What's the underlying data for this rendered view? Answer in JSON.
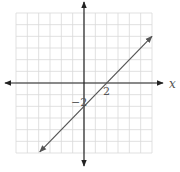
{
  "chart_data": {
    "type": "line",
    "title": "",
    "xlabel": "x",
    "ylabel": "",
    "xlim": [
      -6,
      6
    ],
    "ylim": [
      -6,
      6
    ],
    "grid": true,
    "grid_step": 1,
    "legend": null,
    "series": [
      {
        "name": "y = x - 2",
        "slope": 1,
        "intercept": -2,
        "x": [
          -3.9,
          6.0
        ],
        "y": [
          -5.9,
          4.0
        ],
        "arrows": "both"
      }
    ],
    "annotations": [
      {
        "text": "2",
        "x": 2,
        "y": 0,
        "position": "below-right"
      },
      {
        "text": "−2",
        "x": 0,
        "y": -2,
        "position": "left"
      }
    ]
  },
  "labels": {
    "x_axis": "x",
    "x_intercept": "2",
    "y_intercept": "−2"
  },
  "colors": {
    "grid": "#d9d9d9",
    "axis": "#222222",
    "line": "#555555",
    "text": "#555555"
  }
}
